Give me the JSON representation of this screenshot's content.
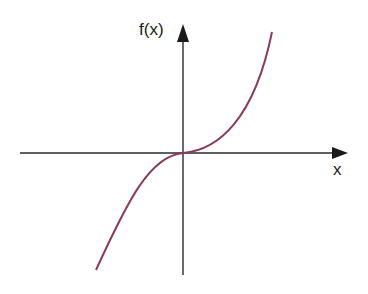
{
  "diagram": {
    "type": "function-graph",
    "function": "cubic (x^3)",
    "labels": {
      "y_axis": "f(x)",
      "x_axis": "x"
    },
    "colors": {
      "axis": "#2a2a2a",
      "curve": "#8a3a5e"
    },
    "origin_px": [
      183,
      153
    ]
  }
}
